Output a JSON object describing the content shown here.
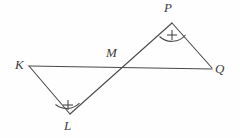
{
  "figure": {
    "type": "geometry-diagram",
    "background_color": "#fefefe",
    "stroke_color": "#4a4a4a",
    "label_color": "#3d3d3d",
    "stroke_width": 1.1,
    "points": [
      {
        "name": "K",
        "label": "K",
        "x": 29,
        "y": 66,
        "label_x": 15,
        "label_y": 58
      },
      {
        "name": "L",
        "label": "L",
        "x": 70,
        "y": 114,
        "label_x": 64,
        "label_y": 119
      },
      {
        "name": "M",
        "label": "M",
        "x": 120,
        "y": 67,
        "label_x": 106,
        "label_y": 46
      },
      {
        "name": "P",
        "label": "P",
        "x": 172,
        "y": 23,
        "label_x": 164,
        "label_y": 1
      },
      {
        "name": "Q",
        "label": "Q",
        "x": 212,
        "y": 68,
        "label_x": 215,
        "label_y": 62
      }
    ],
    "segments": [
      {
        "name": "segment-KQ",
        "from": "K",
        "to": "Q",
        "x1": 29,
        "y1": 66,
        "x2": 212,
        "y2": 69
      },
      {
        "name": "segment-LP",
        "from": "L",
        "to": "P",
        "x1": 70,
        "y1": 114,
        "x2": 172,
        "y2": 23
      },
      {
        "name": "segment-KL",
        "from": "K",
        "to": "L",
        "x1": 29,
        "y1": 66,
        "x2": 70,
        "y2": 114
      },
      {
        "name": "segment-PQ",
        "from": "P",
        "to": "Q",
        "x1": 172,
        "y1": 23,
        "x2": 212,
        "y2": 68
      }
    ],
    "angle_marks": [
      {
        "name": "angle-mark-L",
        "at_vertex": "L",
        "mark_type": "arc-with-plus",
        "arc_path": "M 55.5 104.5 A 18 18 0 0 0 79.5 103.2",
        "plus_cx": 68,
        "plus_cy": 105,
        "plus_size": 5
      },
      {
        "name": "angle-mark-P",
        "at_vertex": "P",
        "mark_type": "arc-with-plus",
        "arc_path": "M 159.5 36.5 A 18 18 0 0 0 185.5 35.0",
        "plus_cx": 172,
        "plus_cy": 35,
        "plus_size": 5
      }
    ]
  }
}
